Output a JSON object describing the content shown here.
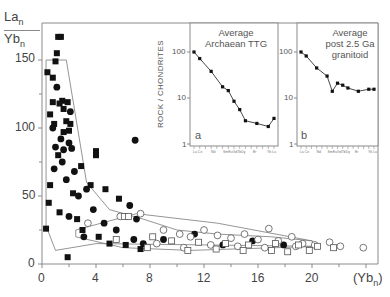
{
  "chart_data": [
    {
      "type": "scatter",
      "title": "",
      "ylabel": "La_n / Yb_n",
      "xlabel": "(Yb_n)",
      "xlim": [
        0,
        24
      ],
      "ylim": [
        0,
        160
      ],
      "x_ticks": [
        "0",
        "4",
        "8",
        "12",
        "16",
        "20"
      ],
      "y_ticks": [
        "0",
        "50",
        "100",
        "150"
      ],
      "grid": false,
      "legend": null,
      "series": [
        {
          "name": "Archaean TTG (filled squares)",
          "marker": "filled-square",
          "points": [
            [
              1.2,
              167
            ],
            [
              1.4,
              167
            ],
            [
              1.1,
              155
            ],
            [
              1.0,
              149
            ],
            [
              0.4,
              141
            ],
            [
              0.8,
              137
            ],
            [
              1.5,
              120
            ],
            [
              1.9,
              119
            ],
            [
              0.8,
              119
            ],
            [
              1.3,
              118
            ],
            [
              1.6,
              114
            ],
            [
              1.8,
              105
            ],
            [
              2.1,
              103
            ],
            [
              0.6,
              110
            ],
            [
              0.9,
              103
            ],
            [
              2.0,
              98
            ],
            [
              1.6,
              97
            ],
            [
              4.0,
              83
            ],
            [
              4.0,
              80
            ],
            [
              1.2,
              80
            ],
            [
              2.9,
              72
            ],
            [
              0.6,
              58
            ],
            [
              3.6,
              58
            ],
            [
              4.7,
              55
            ],
            [
              2.3,
              52
            ],
            [
              5.7,
              48
            ],
            [
              0.5,
              45
            ],
            [
              1.3,
              38
            ],
            [
              2.6,
              33
            ],
            [
              0.3,
              26
            ],
            [
              1.9,
              5
            ],
            [
              3.0,
              25
            ],
            [
              4.2,
              20
            ],
            [
              5.0,
              15
            ],
            [
              6.2,
              14
            ],
            [
              7.3,
              11
            ]
          ]
        },
        {
          "name": "Archaean TTG (filled circles)",
          "marker": "filled-circle",
          "points": [
            [
              1.1,
              130
            ],
            [
              2.1,
              112
            ],
            [
              0.8,
              100
            ],
            [
              1.4,
              92
            ],
            [
              2.0,
              89
            ],
            [
              1.0,
              86
            ],
            [
              1.6,
              84
            ],
            [
              6.9,
              91
            ],
            [
              2.2,
              85
            ],
            [
              1.5,
              75
            ],
            [
              0.9,
              70
            ],
            [
              2.4,
              68
            ],
            [
              1.8,
              62
            ],
            [
              3.3,
              55
            ],
            [
              2.7,
              50
            ],
            [
              6.5,
              43
            ],
            [
              3.8,
              40
            ],
            [
              7.0,
              33
            ],
            [
              2.0,
              35
            ],
            [
              4.6,
              30
            ],
            [
              5.5,
              25
            ],
            [
              3.1,
              20
            ],
            [
              6.8,
              18
            ],
            [
              7.5,
              15
            ],
            [
              9.0,
              18
            ],
            [
              11.3,
              22
            ],
            [
              13.4,
              14
            ],
            [
              15.6,
              17
            ],
            [
              17.9,
              14
            ]
          ]
        },
        {
          "name": "post-Archaean granitoids (open circles)",
          "marker": "open-circle",
          "points": [
            [
              7.3,
              37
            ],
            [
              3.4,
              30
            ],
            [
              5.8,
              35
            ],
            [
              9.0,
              25
            ],
            [
              10.2,
              22
            ],
            [
              11.0,
              20
            ],
            [
              12.0,
              25
            ],
            [
              13.0,
              21
            ],
            [
              14.0,
              19
            ],
            [
              15.0,
              22
            ],
            [
              16.0,
              18
            ],
            [
              16.8,
              26
            ],
            [
              17.5,
              17
            ],
            [
              18.5,
              20
            ],
            [
              19.3,
              15
            ],
            [
              20.2,
              14
            ],
            [
              21.3,
              16
            ],
            [
              22.1,
              13
            ],
            [
              23.8,
              12
            ],
            [
              8.5,
              15
            ],
            [
              10.5,
              12
            ],
            [
              12.5,
              14
            ],
            [
              14.5,
              13
            ],
            [
              16.5,
              12
            ],
            [
              18.8,
              13
            ]
          ]
        },
        {
          "name": "post-Archaean granitoids (open squares)",
          "marker": "open-square",
          "points": [
            [
              6.1,
              35
            ],
            [
              6.4,
              35
            ],
            [
              8.2,
              20
            ],
            [
              9.6,
              17
            ],
            [
              11.6,
              16
            ],
            [
              13.6,
              15
            ],
            [
              15.3,
              14
            ],
            [
              17.3,
              15
            ],
            [
              19.0,
              14
            ],
            [
              20.4,
              13
            ],
            [
              21.6,
              12
            ],
            [
              5.5,
              18
            ],
            [
              7.8,
              12
            ],
            [
              10.8,
              10
            ],
            [
              12.9,
              11
            ],
            [
              14.9,
              10
            ],
            [
              17.0,
              10
            ],
            [
              18.2,
              9
            ],
            [
              19.8,
              10
            ]
          ]
        }
      ],
      "envelopes": [
        {
          "name": "Archaean TTG field",
          "polygon": [
            [
              0.3,
              150
            ],
            [
              1.8,
              150
            ],
            [
              3.3,
              60
            ],
            [
              5.0,
              40
            ],
            [
              7.5,
              33
            ],
            [
              10.0,
              25
            ],
            [
              13.0,
              22
            ],
            [
              17.0,
              20
            ],
            [
              20.0,
              17
            ],
            [
              20.5,
              13
            ],
            [
              4.0,
              15
            ],
            [
              1.0,
              10
            ],
            [
              0.3,
              28
            ]
          ]
        },
        {
          "name": "post-Archaean field",
          "polygon": [
            [
              2.5,
              25
            ],
            [
              7.0,
              37
            ],
            [
              13.0,
              30
            ],
            [
              20.0,
              17
            ],
            [
              20.5,
              13
            ],
            [
              11.0,
              10
            ],
            [
              6.0,
              12
            ],
            [
              2.5,
              20
            ]
          ]
        }
      ]
    },
    {
      "type": "line",
      "panel": "a",
      "title": "Average Archaean TTG",
      "ylabel": "ROCK / CHONDRITES",
      "yscale": "log",
      "ylim": [
        1,
        300
      ],
      "y_ticks": [
        "1",
        "10",
        "100"
      ],
      "categories": [
        "La",
        "Ce",
        "Nd",
        "Sm",
        "Eu",
        "Gd",
        "Tb",
        "Dy",
        "Er",
        "Yb",
        "Lu"
      ],
      "values": [
        100,
        72,
        38,
        17.5,
        14.5,
        8.5,
        5.6,
        3.2,
        2.8,
        2.4,
        3.6
      ]
    },
    {
      "type": "line",
      "panel": "b",
      "title": "Average post 2.5 Ga granitoid",
      "ylabel": "ROCK / CHONDRITES",
      "yscale": "log",
      "ylim": [
        1,
        300
      ],
      "y_ticks": [
        "1",
        "10",
        "100"
      ],
      "categories": [
        "La",
        "Ce",
        "Nd",
        "Sm",
        "Eu",
        "Gd",
        "Tb",
        "Dy",
        "Er",
        "Yb",
        "Lu"
      ],
      "values": [
        100,
        82,
        45,
        30,
        14,
        21,
        19,
        16.5,
        14,
        15.5,
        15.5
      ]
    }
  ],
  "main_plot": {
    "y_axis_label_top": "La",
    "y_axis_label_top_sub": "n",
    "y_axis_label_bottom": "Yb",
    "y_axis_label_bottom_sub": "n",
    "x_axis_label": "(Yb",
    "x_axis_label_sub": "n",
    "x_axis_label_close": ")",
    "x_ticks": [
      "0",
      "4",
      "8",
      "12",
      "16",
      "20"
    ],
    "y_ticks": [
      "0",
      "50",
      "100",
      "150"
    ]
  },
  "inset_a": {
    "title_line1": "Average",
    "title_line2": "Archaean TTG",
    "panel_letter": "a",
    "y_label": "ROCK / CHONDRITES",
    "y_ticks": [
      "100",
      "10",
      "1"
    ],
    "ree_labels": [
      "La Ce",
      "Nd",
      "SmEuGdTbDy",
      "Er",
      "Yb Lu"
    ]
  },
  "inset_b": {
    "title_line1": "Average",
    "title_line2": "post 2.5 Ga",
    "title_line3": "granitoid",
    "panel_letter": "b",
    "y_ticks": [
      "100",
      "10",
      "1"
    ],
    "ree_labels": [
      "La Ce",
      "Nd",
      "SmEuGdTbDy",
      "Er",
      "Yb Lu"
    ]
  },
  "colors": {
    "axis": "#8a8a8a",
    "marker_fill": "#111111",
    "open_marker_stroke": "#555555",
    "envelope": "#777777",
    "text": "#444444"
  }
}
